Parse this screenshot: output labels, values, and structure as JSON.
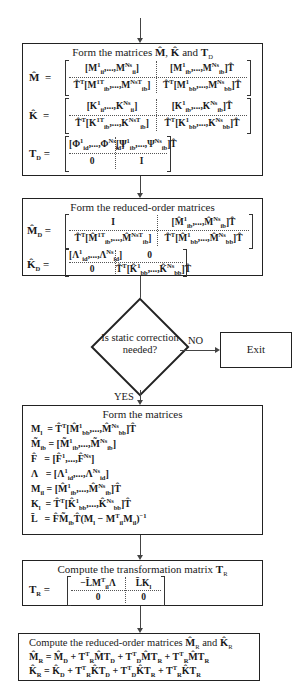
{
  "box1": {
    "title": "Form the matrices M̂, K̂ and T_D",
    "M_hat": {
      "lhs": "M̂ =",
      "r1c1": "[M¹_ii, ..., M^Ns_ii]",
      "r1c2": "[M¹_ib, ..., M^Ns_ib]T̂",
      "r2c1": "T̂ᵀ[M¹ᵀ_ib, ..., M^NsT_ib]",
      "r2c2": "T̂ᵀ[M¹_bb, ..., M^Ns_bb]T̂"
    },
    "K_hat": {
      "lhs": "K̂ =",
      "r1c1": "[K¹_ii, ..., K^Ns_ii]",
      "r1c2": "[K¹_ib, ..., K^Ns_ib]T̂",
      "r2c1": "T̂ᵀ[K¹ᵀ_ib, ..., K^NsT_ib]",
      "r2c2": "T̂ᵀ[K¹_bb, ..., K^Ns_bb]T̂"
    },
    "T_D": {
      "lhs": "T_D =",
      "r1c1": "[Φ¹_id, ..., Φ^Ns_id]",
      "r1c2": "[Ψ¹_ib, ..., Ψ^Ns_ib]T̂",
      "r2c1": "0",
      "r2c2": "I"
    }
  },
  "box2": {
    "title": "Form the reduced-order matrices",
    "M_D": {
      "lhs": "M̂_D =",
      "r1c1": "I",
      "r1c2": "[M̂¹_ib, ..., M̂^Ns_ib]T̂",
      "r2c1": "T̂ᵀ[M̂¹ᵀ_ib, ..., M̂^NsT_ib]",
      "r2c2": "T̂ᵀ[M̂¹_bb, ..., M̂^Ns_bb]T̂"
    },
    "K_D": {
      "lhs": "K̂_D =",
      "r1c1": "[Λ¹_id, ..., Λ^Ns_id]",
      "r1c2": "0",
      "r2c1": "0",
      "r2c2": "T̂ᵀ[K̂¹_bb, ..., K̂^Ns_bb]T̂"
    }
  },
  "decision": {
    "text": "Is static correction needed?",
    "no_label": "NO",
    "yes_label": "YES",
    "exit_label": "Exit"
  },
  "box3": {
    "title": "Form the matrices",
    "lines": [
      "M_l = T̂ᵀ[M̂¹_bb, ..., M̂^Ns_bb]T̂",
      "M̃_ib = [M̃¹_ib, ..., M̃^Ns_ib]",
      "F̂ = [F̂¹, ..., F̂^Ns]",
      "Λ = [Λ¹_id, ..., Λ^Ns_id]",
      "M_il = [M̂¹_ib, ..., M̂^Ns_ib]T̂",
      "K_l = T̂ᵀ[K̂¹_bb, ..., K̂^Ns_bb]T̂",
      "L̄ = F̂M̃_ibT̂(M_l − Mᵀ_il M_il)⁻¹"
    ]
  },
  "box4": {
    "title": "Compute the transformation matrix T_R",
    "lhs": "T_R =",
    "r1c1": "−L̄Mᵀ_il Λ",
    "r1c2": "L̄K_l",
    "r2c1": "0",
    "r2c2": "0"
  },
  "box5": {
    "title": "Compute the reduced-order matrices M̂_R and K̂_R",
    "lines": [
      "M̂_R = M̂_D + Tᵀ_R M̂ T_D + Tᵀ_D M̂ T_R + Tᵀ_R M̂ T_R",
      "K̂_R = K̂_D + Tᵀ_R K̂ T_D + Tᵀ_D K̂ T_R + Tᵀ_R K̂ T_R"
    ]
  }
}
